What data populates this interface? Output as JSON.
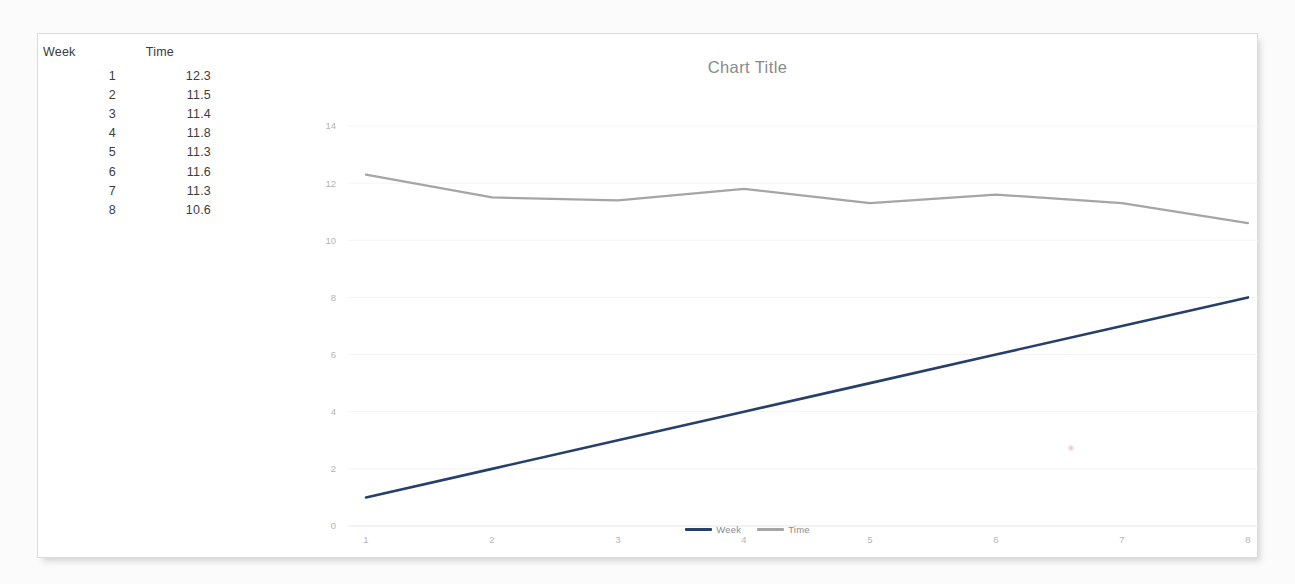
{
  "document": {
    "background_color": "#fbfbfb",
    "card_color": "#ffffff"
  },
  "table": {
    "name": "week-time-table",
    "headers": [
      "Week",
      "Time"
    ],
    "rows": [
      {
        "week": "1",
        "time": "12.3"
      },
      {
        "week": "2",
        "time": "11.5"
      },
      {
        "week": "3",
        "time": "11.4"
      },
      {
        "week": "4",
        "time": "11.8"
      },
      {
        "week": "5",
        "time": "11.3"
      },
      {
        "week": "6",
        "time": "11.6"
      },
      {
        "week": "7",
        "time": "11.3"
      },
      {
        "week": "8",
        "time": "10.6"
      }
    ]
  },
  "chart_data": {
    "type": "line",
    "title": "Chart Title",
    "xlabel": "",
    "ylabel": "",
    "categories": [
      "1",
      "2",
      "3",
      "4",
      "5",
      "6",
      "7",
      "8"
    ],
    "x": [
      1,
      2,
      3,
      4,
      5,
      6,
      7,
      8
    ],
    "xlim": [
      1,
      8
    ],
    "ylim": [
      0,
      14
    ],
    "yticks": [
      0,
      2,
      4,
      6,
      8,
      10,
      12,
      14
    ],
    "ytick_labels": [
      "0",
      "2",
      "4",
      "6",
      "8",
      "10",
      "12",
      "14"
    ],
    "xtick_labels": [
      "1",
      "2",
      "3",
      "4",
      "5",
      "6",
      "7",
      "8"
    ],
    "grid": true,
    "legend_position": "bottom",
    "series": [
      {
        "name": "Week",
        "color": "#27406b",
        "width": 2.6,
        "values": [
          1,
          2,
          3,
          4,
          5,
          6,
          7,
          8
        ]
      },
      {
        "name": "Time",
        "color": "#a5a5a5",
        "width": 2.2,
        "values": [
          12.3,
          11.5,
          11.4,
          11.8,
          11.3,
          11.6,
          11.3,
          10.6
        ]
      }
    ]
  },
  "legend": {
    "items": [
      {
        "label": "Week",
        "color": "#27406b"
      },
      {
        "label": "Time",
        "color": "#a5a5a5"
      }
    ]
  }
}
